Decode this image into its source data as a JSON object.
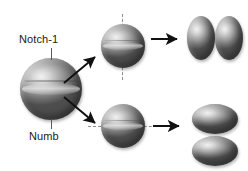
{
  "figure": {
    "background_color": "#ffffff",
    "cell_fill_color": "#9b9b9b",
    "axis_color": "#8f8f8f",
    "arrow_color": "#111111",
    "label_color": "#1a1a1a"
  },
  "labels": {
    "notch": "Notch-1",
    "numb": "Numb"
  },
  "cells": {
    "mother": {
      "name": "mother-cell",
      "shape": "sphere"
    },
    "spindle_vertical": {
      "name": "dividing-cell-vertical-axis",
      "shape": "sphere",
      "axis": "vertical"
    },
    "spindle_horizontal": {
      "name": "dividing-cell-horizontal-axis",
      "shape": "sphere",
      "axis": "horizontal"
    },
    "daughters_symmetric": [
      {
        "name": "daughter-cell-left",
        "shape": "tall-ellipse"
      },
      {
        "name": "daughter-cell-right",
        "shape": "tall-ellipse"
      }
    ],
    "daughters_asymmetric": [
      {
        "name": "daughter-cell-top",
        "shape": "wide-ellipse"
      },
      {
        "name": "daughter-cell-bottom",
        "shape": "wide-ellipse"
      }
    ]
  },
  "arrows": {
    "to_symmetric": "arrow-up-right",
    "to_asymmetric": "arrow-down-right",
    "to_daughters_top": "arrow-right",
    "to_daughters_bottom": "arrow-right"
  },
  "axes": {
    "vertical": "vertical-dashed-division-axis",
    "horizontal": "horizontal-dashed-division-axis"
  }
}
